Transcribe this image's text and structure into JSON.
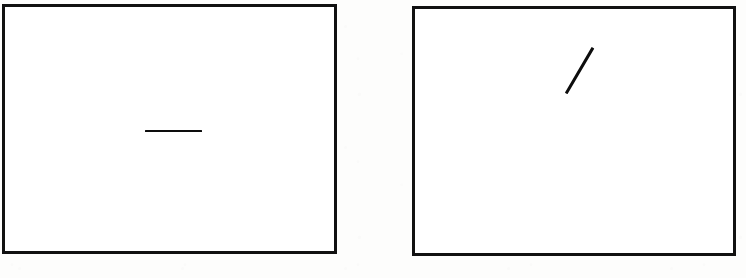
{
  "figure": {
    "background_color": "#fdfdfc",
    "ink_color": "#111111",
    "width": 746,
    "height": 278
  },
  "panels": [
    {
      "id": "left-panel",
      "label": "Left stimulus panel",
      "frame": {
        "x": 2,
        "y": 4,
        "width": 335,
        "height": 250,
        "border_width": 3,
        "border_color": "#111111",
        "fill_color": "#ffffff"
      },
      "stimulus": {
        "name": "horizontal-line",
        "orientation": "horizontal",
        "orientation_degrees": 0,
        "x1": 145,
        "y1": 131,
        "x2": 202,
        "y2": 131,
        "length": 57,
        "thickness": 2.6,
        "color": "#0d0d0d"
      }
    },
    {
      "id": "right-panel",
      "label": "Right stimulus panel",
      "frame": {
        "x": 412,
        "y": 6,
        "width": 324,
        "height": 250,
        "border_width": 3,
        "border_color": "#111111",
        "fill_color": "#ffffff"
      },
      "stimulus": {
        "name": "oblique-line",
        "orientation": "oblique-up-right",
        "orientation_degrees": 60,
        "x1": 566,
        "y1": 93,
        "x2": 593,
        "y2": 47,
        "length": 53,
        "thickness": 2.6,
        "color": "#0d0d0d"
      }
    }
  ],
  "chart_data": {
    "type": "scatter",
    "xlabel": "",
    "ylabel": "",
    "series": [
      {
        "name": "Left panel line segment",
        "points": [
          {
            "x": 145,
            "y": 131
          },
          {
            "x": 202,
            "y": 131
          }
        ],
        "orientation_degrees": 0,
        "length_px": 57
      },
      {
        "name": "Right panel line segment",
        "points": [
          {
            "x": 566,
            "y": 93
          },
          {
            "x": 593,
            "y": 47
          }
        ],
        "orientation_degrees": 60,
        "length_px": 53
      }
    ],
    "xlim": [
      0,
      746
    ],
    "ylim": [
      0,
      278
    ],
    "grid": false,
    "legend": "none"
  }
}
